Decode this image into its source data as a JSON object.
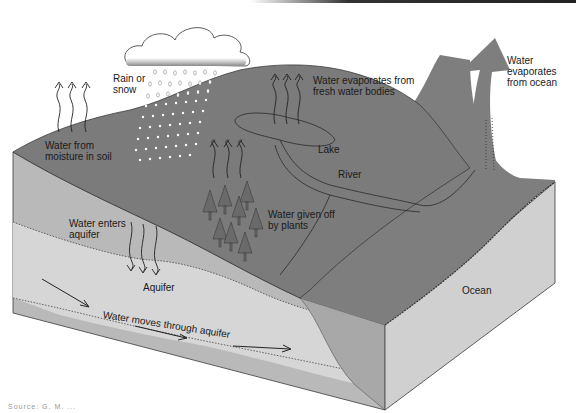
{
  "diagram": {
    "labels": {
      "rain": [
        "Rain or",
        "snow"
      ],
      "soil": [
        "Water from",
        "moisture in soil"
      ],
      "freshwater": [
        "Water evaporates from",
        "fresh water bodies"
      ],
      "ocean_evap": [
        "Water",
        "evaporates",
        "from ocean"
      ],
      "lake": "Lake",
      "river": "River",
      "plants": [
        "Water given off",
        "by plants"
      ],
      "enters_aquifer": [
        "Water enters",
        "aquifer"
      ],
      "aquifer": "Aquifer",
      "moves": "Water moves through aquifer",
      "ocean": "Ocean"
    },
    "credit": "Source: G. M. ...",
    "colors": {
      "land_top": "#7b7b7b",
      "front_face": "#b9b9b9",
      "aquifer_band": "#d4d4d4",
      "ocean_face": "#cfcfcf",
      "ocean_top": "#7e7e7e",
      "outline": "#3a3a3a"
    }
  }
}
